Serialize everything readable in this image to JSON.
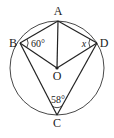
{
  "diagram": {
    "type": "circle-geometry",
    "points": {
      "A": "A",
      "B": "B",
      "C": "C",
      "D": "D",
      "O": "O"
    },
    "angles": {
      "angle_B": "60°",
      "angle_D": "x",
      "angle_C": "58°"
    },
    "segments": [
      "AB",
      "AD",
      "AO",
      "BO",
      "DO",
      "BC",
      "DC"
    ],
    "circle": "circle centered at O through A, B, C, D",
    "colors": {
      "ink": "#222222",
      "background": "#ffffff"
    }
  }
}
